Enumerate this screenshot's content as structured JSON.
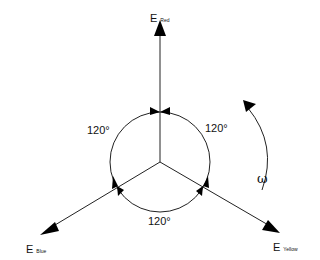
{
  "phasors": {
    "red": {
      "symbol": "E",
      "subscript": "Red"
    },
    "blue": {
      "symbol": "E",
      "subscript": "Blue"
    },
    "yellow": {
      "symbol": "E",
      "subscript": "Yellow"
    }
  },
  "angles": {
    "left": "120°",
    "right": "120°",
    "bottom": "120°"
  },
  "rotation": {
    "symbol": "ω"
  }
}
